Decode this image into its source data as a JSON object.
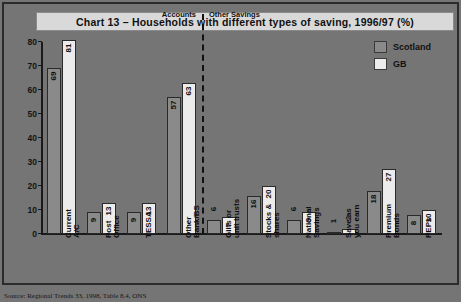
{
  "chart_data": {
    "type": "bar",
    "title": "Chart 13 – Households with different types of saving, 1996/97 (%)",
    "xlabel": "",
    "ylabel": "",
    "ylim": [
      0,
      80
    ],
    "yticks": [
      0,
      10,
      20,
      30,
      40,
      50,
      60,
      70,
      80
    ],
    "grid": false,
    "legend_position": "top-right",
    "categories": [
      "Current A/C",
      "Post Office",
      "TESSA",
      "Other Bank/BS",
      "Gilts or unit trusts",
      "Stocks & shares",
      "National Savings",
      "Save as you earn",
      "Premium Bonds",
      "PEPs"
    ],
    "series": [
      {
        "name": "Scotland",
        "color": "#8a8a8a",
        "values": [
          69,
          9,
          9,
          57,
          6,
          16,
          6,
          1,
          18,
          8
        ]
      },
      {
        "name": "GB",
        "color": "#ececec",
        "values": [
          81,
          13,
          13,
          63,
          7,
          20,
          9,
          2,
          27,
          10
        ]
      }
    ],
    "annotations": [
      {
        "text": "Accounts",
        "note": "left of dashed divider"
      },
      {
        "text": "Other Savings",
        "note": "right of dashed divider"
      }
    ],
    "divider_after_category": "Other Bank/BS"
  },
  "legend": {
    "items": [
      {
        "label": "Scotland"
      },
      {
        "label": "GB"
      }
    ]
  },
  "source": {
    "text": "Source: Regional Trends 33, 1998, Table 8.4, ONS"
  }
}
